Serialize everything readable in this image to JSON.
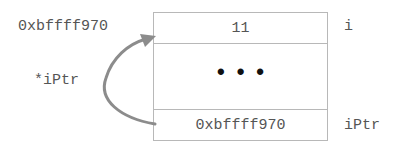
{
  "diagram": {
    "type": "memory-layout",
    "cells": [
      {
        "value": "11",
        "name": "i",
        "address": "0xbffff970"
      },
      {
        "value": "...",
        "name": ""
      },
      {
        "value": "0xbffff970",
        "name": "iPtr"
      }
    ],
    "address_label": "0xbffff970",
    "pointer_label": "*iPtr",
    "arrow": {
      "from": "iPtr",
      "to": "i",
      "color": "#8c8c8c"
    },
    "border_color": "#b8b8b8"
  }
}
